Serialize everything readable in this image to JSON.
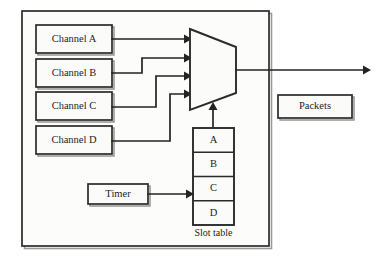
{
  "diagram": {
    "type": "block-diagram",
    "colors": {
      "stroke": "#2b2b2b",
      "wire": "#232323",
      "box_fill": "#fbfbfa",
      "frame_fill": "#fcfcfb",
      "shadow": "#8e8e8e",
      "background": "#ffffff"
    },
    "outer_frame": {
      "name": "device-boundary",
      "x": 22,
      "y": 11,
      "width": 247,
      "height": 235
    },
    "channels": [
      {
        "label": "Channel A",
        "x": 36,
        "y": 25,
        "width": 76,
        "height": 28
      },
      {
        "label": "Channel B",
        "x": 36,
        "y": 59,
        "width": 76,
        "height": 28
      },
      {
        "label": "Channel C",
        "x": 36,
        "y": 92,
        "width": 76,
        "height": 28
      },
      {
        "label": "Channel D",
        "x": 36,
        "y": 126,
        "width": 76,
        "height": 28
      }
    ],
    "multiplexer": {
      "name": "multiplexer",
      "shape": "trapezoid",
      "left_x": 190,
      "right_x": 236,
      "top_y": 29,
      "bottom_y": 110,
      "right_top_y": 47,
      "right_bottom_y": 93,
      "input_arrow_y": [
        39,
        58,
        76,
        94
      ],
      "output_y": 70,
      "control_arrow_x": 213
    },
    "slot_table": {
      "name": "slot-table",
      "caption": "Slot table",
      "x": 193,
      "y": 128,
      "width": 41,
      "height": 97,
      "rows": [
        "A",
        "B",
        "C",
        "D"
      ]
    },
    "timer": {
      "label": "Timer",
      "x": 88,
      "y": 184,
      "width": 60,
      "height": 20
    },
    "packets": {
      "label": "Packets",
      "x": 278,
      "y": 95,
      "width": 74,
      "height": 23
    },
    "output_line": {
      "name": "output-stream",
      "from_x": 236,
      "to_x": 370,
      "y": 70
    }
  }
}
